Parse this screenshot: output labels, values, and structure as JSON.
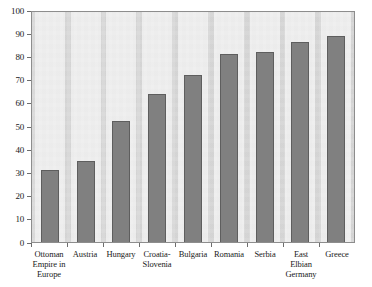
{
  "chart_data": {
    "type": "bar",
    "title": "",
    "subtitle": "",
    "xlabel": "",
    "ylabel": "",
    "ylim": [
      0,
      100
    ],
    "grid": false,
    "legend": "none",
    "y_ticks": [
      0,
      10,
      20,
      30,
      40,
      50,
      60,
      70,
      80,
      90,
      100
    ],
    "y_tick_labels": [
      "0",
      "10",
      "20",
      "30",
      "40",
      "50",
      "60",
      "70",
      "80",
      "90",
      "100"
    ],
    "categories": [
      "Ottoman Empire in Europe",
      "Austria",
      "Hungary",
      "Croatia-Slovenia",
      "Bulgaria",
      "Romania",
      "Serbia",
      "East Elbian Germany",
      "Greece"
    ],
    "category_label_lines": [
      [
        "Ottoman",
        "Empire in",
        "Europe"
      ],
      [
        "Austria"
      ],
      [
        "Hungary"
      ],
      [
        "Croatia-",
        "Slovenia"
      ],
      [
        "Bulgaria"
      ],
      [
        "Romania"
      ],
      [
        "Serbia"
      ],
      [
        "East Elbian",
        "Germany"
      ],
      [
        "Greece"
      ]
    ],
    "values": [
      31,
      35,
      52,
      64,
      72,
      81,
      82,
      86,
      89
    ],
    "colors": {
      "bar_fill": "#808080",
      "bar_border": "#5e5e5e",
      "plot_background": "#d9d9d9",
      "page_background": "#ffffff",
      "axis": "#6d6d6d",
      "text": "#1a1a1a"
    }
  }
}
